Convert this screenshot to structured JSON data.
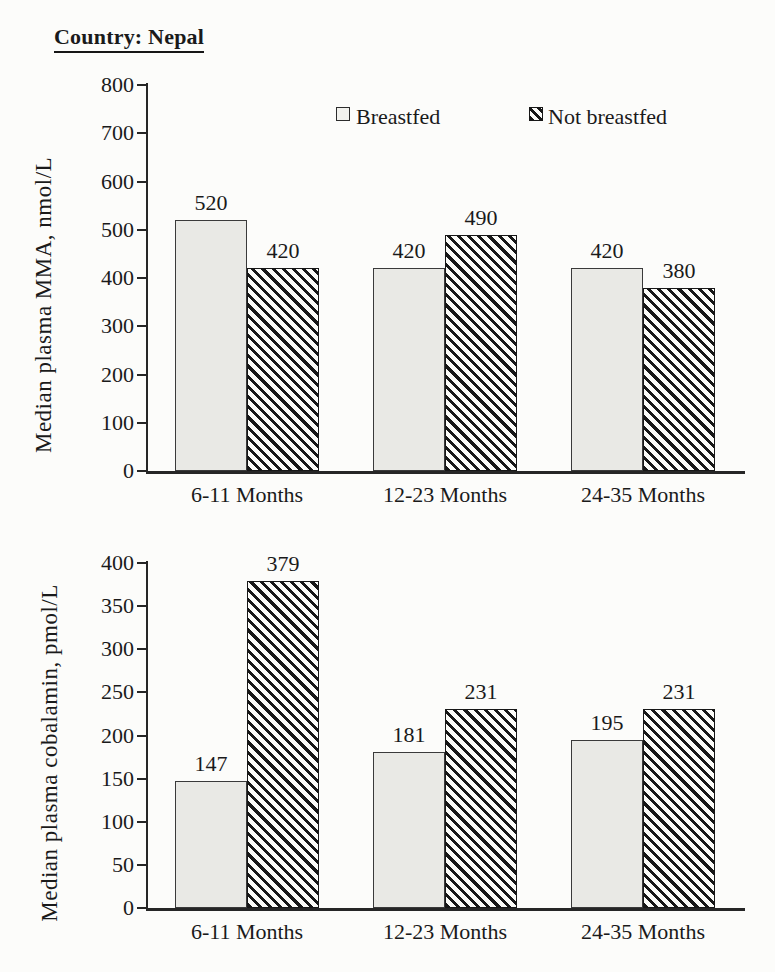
{
  "page_title": "Country: Nepal",
  "legend": {
    "items": [
      {
        "label": "Breastfed",
        "style": "light"
      },
      {
        "label": "Not breastfed",
        "style": "hatch"
      }
    ]
  },
  "colors": {
    "ink": "#1a1a1a",
    "axis": "#262626",
    "bar_light_fill": "#e9e9e5",
    "bar_border": "#3a3a3a",
    "hatch_dark": "#171717",
    "background": "#fcfcfa"
  },
  "chart_data": [
    {
      "type": "bar",
      "title": "",
      "ylabel": "Median plasma MMA, nmol/L",
      "xlabel": "",
      "categories": [
        "6-11 Months",
        "12-23 Months",
        "24-35 Months"
      ],
      "series": [
        {
          "name": "Breastfed",
          "values": [
            520,
            420,
            420
          ]
        },
        {
          "name": "Not breastfed",
          "values": [
            420,
            490,
            380
          ]
        }
      ],
      "ylim": [
        0,
        800
      ],
      "ytick_step": 100,
      "grid": false,
      "data_labels": true,
      "legend_position": "top-inside"
    },
    {
      "type": "bar",
      "title": "",
      "ylabel": "Median plasma cobalamin, pmol/L",
      "xlabel": "",
      "categories": [
        "6-11 Months",
        "12-23 Months",
        "24-35 Months"
      ],
      "series": [
        {
          "name": "Breastfed",
          "values": [
            147,
            181,
            195
          ]
        },
        {
          "name": "Not breastfed",
          "values": [
            379,
            231,
            231
          ]
        }
      ],
      "ylim": [
        0,
        400
      ],
      "ytick_step": 50,
      "grid": false,
      "data_labels": true,
      "legend_position": "none"
    }
  ]
}
